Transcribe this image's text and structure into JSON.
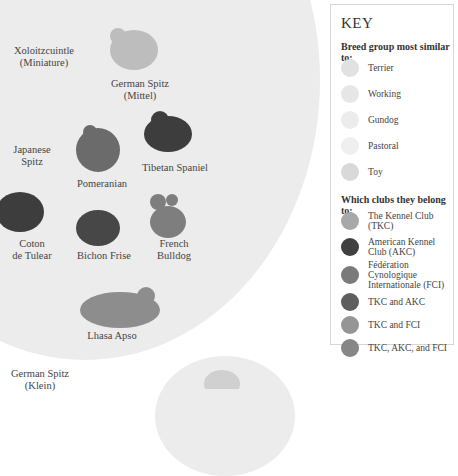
{
  "breeds": [
    {
      "id": "xolo",
      "label": "Xoloitzcuintle\n(Miniature)",
      "lines": [
        "Xoloitzcuintle",
        "(Miniature)"
      ]
    },
    {
      "id": "german-spitz-mittel",
      "lines": [
        "German Spitz",
        "(Mittel)"
      ]
    },
    {
      "id": "japanese-spitz",
      "lines": [
        "Japanese",
        "Spitz"
      ]
    },
    {
      "id": "pomeranian",
      "lines": [
        "Pomeranian"
      ]
    },
    {
      "id": "tibetan-spaniel",
      "lines": [
        "Tibetan Spaniel"
      ]
    },
    {
      "id": "coton",
      "lines": [
        "Coton",
        "de Tulear"
      ]
    },
    {
      "id": "bichon",
      "lines": [
        "Bichon Frise"
      ]
    },
    {
      "id": "french-bulldog",
      "lines": [
        "French",
        "Bulldog"
      ]
    },
    {
      "id": "lhasa",
      "lines": [
        "Lhasa Apso"
      ]
    },
    {
      "id": "german-spitz-klein",
      "lines": [
        "German Spitz",
        "(Klein)"
      ]
    }
  ],
  "key": {
    "title": "KEY",
    "group_heading": "Breed group most similar to:",
    "groups": [
      {
        "label": "Terrier",
        "color": "#e1e1e1"
      },
      {
        "label": "Working",
        "color": "#e6e6e6"
      },
      {
        "label": "Gundog",
        "color": "#ececec"
      },
      {
        "label": "Pastoral",
        "color": "#efefef"
      },
      {
        "label": "Toy",
        "color": "#d9d9d9"
      }
    ],
    "club_heading": "Which clubs they belong to:",
    "clubs": [
      {
        "label": "The Kennel Club (TKC)",
        "color": "#a8a8a8"
      },
      {
        "label": "American Kennel Club (AKC)",
        "color": "#404040"
      },
      {
        "label": "Fédération Cynologique Internationale (FCI)",
        "lines": [
          "Fédération Cynologique",
          "Internationale (FCI)"
        ],
        "color": "#7a7a7a"
      },
      {
        "label": "TKC and AKC",
        "color": "#5e5e5e"
      },
      {
        "label": "TKC and FCI",
        "color": "#959595"
      },
      {
        "label": "TKC, AKC, and FCI",
        "color": "#868686"
      }
    ]
  }
}
